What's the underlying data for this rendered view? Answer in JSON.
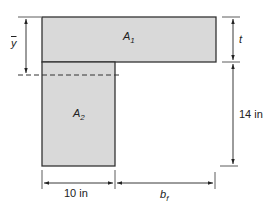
{
  "diagram": {
    "type": "T-section cross-section (centroid)",
    "colors": {
      "fill": "#d9d9d9",
      "stroke": "#333333",
      "dimension": "#222222"
    },
    "shapes": {
      "flange": {
        "label_main": "A",
        "label_sub": "1"
      },
      "web": {
        "label_main": "A",
        "label_sub": "2"
      }
    },
    "dimensions": {
      "centroid": {
        "label": "y"
      },
      "flange_thickness": {
        "label": "t"
      },
      "web_height": {
        "label": "14 in"
      },
      "web_width": {
        "label": "10 in"
      },
      "flange_overhang": {
        "label_main": "b",
        "label_sub": "f"
      }
    }
  }
}
